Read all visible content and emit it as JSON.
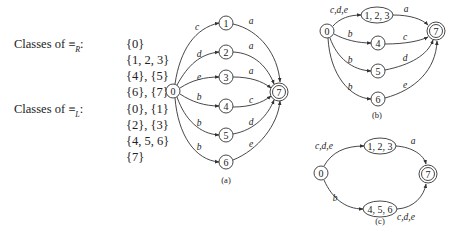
{
  "classes": {
    "right": {
      "label_prefix": "Classes of ≡",
      "label_sub": "R",
      "label_suffix": ":",
      "values": [
        "{0}",
        "{1, 2, 3}",
        "{4}, {5}",
        "{6}, {7}"
      ]
    },
    "left": {
      "label_prefix": "Classes of ≡",
      "label_sub": "L",
      "label_suffix": ":",
      "values": [
        "{0}, {1}",
        "{2}, {3}",
        "{4, 5, 6}",
        "{7}"
      ]
    }
  },
  "diagrams": {
    "a": {
      "caption": "(a)",
      "caption_pos": [
        226,
        183
      ],
      "nodes": [
        {
          "id": "0",
          "label": "0",
          "x": 173,
          "y": 91,
          "rx": 7,
          "ry": 7,
          "final": false
        },
        {
          "id": "1",
          "label": "1",
          "x": 226,
          "y": 23,
          "rx": 7,
          "ry": 7,
          "final": false
        },
        {
          "id": "2",
          "label": "2",
          "x": 226,
          "y": 52,
          "rx": 7,
          "ry": 7,
          "final": false
        },
        {
          "id": "3",
          "label": "3",
          "x": 226,
          "y": 77,
          "rx": 7,
          "ry": 7,
          "final": false
        },
        {
          "id": "4",
          "label": "4",
          "x": 226,
          "y": 106,
          "rx": 7,
          "ry": 7,
          "final": false
        },
        {
          "id": "5",
          "label": "5",
          "x": 226,
          "y": 135,
          "rx": 7,
          "ry": 7,
          "final": false
        },
        {
          "id": "6",
          "label": "6",
          "x": 226,
          "y": 162,
          "rx": 7,
          "ry": 7,
          "final": false
        },
        {
          "id": "7",
          "label": "7",
          "x": 279,
          "y": 92,
          "rx": 9,
          "ry": 9,
          "final": true
        }
      ],
      "edges": [
        {
          "from": "0",
          "to": "1",
          "label": "c",
          "path": "M175,84 C180,50 195,28 219,23",
          "lx": 197,
          "ly": 30
        },
        {
          "from": "0",
          "to": "2",
          "label": "d",
          "path": "M177,85 C188,65 200,54 219,52",
          "lx": 199,
          "ly": 57
        },
        {
          "from": "0",
          "to": "3",
          "label": "e",
          "path": "M180,88 C192,80 205,77 219,77",
          "lx": 199,
          "ly": 80
        },
        {
          "from": "0",
          "to": "4",
          "label": "b",
          "path": "M180,94 C192,102 205,106 219,106",
          "lx": 199,
          "ly": 100
        },
        {
          "from": "0",
          "to": "5",
          "label": "b",
          "path": "M177,97 C185,120 200,134 219,135",
          "lx": 199,
          "ly": 126
        },
        {
          "from": "0",
          "to": "6",
          "label": "b",
          "path": "M175,98 C178,135 195,160 219,162",
          "lx": 199,
          "ly": 150
        },
        {
          "from": "1",
          "to": "7",
          "label": "a",
          "path": "M233,24 C260,30 278,55 280,82",
          "lx": 251,
          "ly": 24
        },
        {
          "from": "2",
          "to": "7",
          "label": "a",
          "path": "M233,52 C255,53 268,68 274,84",
          "lx": 251,
          "ly": 49
        },
        {
          "from": "3",
          "to": "7",
          "label": "a",
          "path": "M233,77 C250,77 262,81 271,88",
          "lx": 251,
          "ly": 74
        },
        {
          "from": "4",
          "to": "7",
          "label": "c",
          "path": "M233,107 C250,107 262,103 271,96",
          "lx": 251,
          "ly": 103
        },
        {
          "from": "5",
          "to": "7",
          "label": "d",
          "path": "M233,134 C255,130 268,115 274,100",
          "lx": 251,
          "ly": 125
        },
        {
          "from": "6",
          "to": "7",
          "label": "e",
          "path": "M233,160 C258,150 278,125 280,101",
          "lx": 251,
          "ly": 147
        }
      ]
    },
    "b": {
      "caption": "(b)",
      "caption_pos": [
        377,
        118
      ],
      "nodes": [
        {
          "id": "0",
          "label": "0",
          "x": 327,
          "y": 31,
          "rx": 7,
          "ry": 7,
          "final": false
        },
        {
          "id": "123",
          "label": "1, 2, 3",
          "x": 377,
          "y": 15,
          "rx": 16,
          "ry": 8,
          "final": false
        },
        {
          "id": "4",
          "label": "4",
          "x": 378,
          "y": 43,
          "rx": 7,
          "ry": 7,
          "final": false
        },
        {
          "id": "5",
          "label": "5",
          "x": 378,
          "y": 71,
          "rx": 7,
          "ry": 7,
          "final": false
        },
        {
          "id": "6",
          "label": "6",
          "x": 378,
          "y": 99,
          "rx": 7,
          "ry": 7,
          "final": false
        },
        {
          "id": "7",
          "label": "7",
          "x": 436,
          "y": 31,
          "rx": 9,
          "ry": 9,
          "final": true
        }
      ],
      "edges": [
        {
          "from": "0",
          "to": "123",
          "label": "c,d,e",
          "path": "M333,26 C340,18 350,15 361,15",
          "lx": 339,
          "ly": 13
        },
        {
          "from": "0",
          "to": "4",
          "label": "b",
          "path": "M334,34 C345,40 358,43 371,43",
          "lx": 350,
          "ly": 37
        },
        {
          "from": "0",
          "to": "5",
          "label": "b",
          "path": "M330,38 C337,58 352,70 371,71",
          "lx": 350,
          "ly": 63
        },
        {
          "from": "0",
          "to": "6",
          "label": "b",
          "path": "M328,38 C330,75 350,98 371,99",
          "lx": 350,
          "ly": 90
        },
        {
          "from": "123",
          "to": "7",
          "label": "a",
          "path": "M393,15 C410,15 422,19 428,25",
          "lx": 406,
          "ly": 12
        },
        {
          "from": "4",
          "to": "7",
          "label": "c",
          "path": "M385,44 C405,44 420,41 428,37",
          "lx": 405,
          "ly": 40
        },
        {
          "from": "5",
          "to": "7",
          "label": "d",
          "path": "M385,70 C410,65 428,55 433,40",
          "lx": 405,
          "ly": 61
        },
        {
          "from": "6",
          "to": "7",
          "label": "e",
          "path": "M385,98 C415,90 436,70 437,41",
          "lx": 405,
          "ly": 88
        }
      ]
    },
    "c": {
      "caption": "(c)",
      "caption_pos": [
        380,
        224
      ],
      "nodes": [
        {
          "id": "0",
          "label": "0",
          "x": 321,
          "y": 173,
          "rx": 7,
          "ry": 7,
          "final": false
        },
        {
          "id": "123",
          "label": "1, 2, 3",
          "x": 380,
          "y": 146,
          "rx": 16,
          "ry": 8,
          "final": false
        },
        {
          "id": "456",
          "label": "4, 5, 6",
          "x": 380,
          "y": 209,
          "rx": 17,
          "ry": 8,
          "final": false
        },
        {
          "id": "7",
          "label": "7",
          "x": 428,
          "y": 174,
          "rx": 9,
          "ry": 9,
          "final": true
        }
      ],
      "edges": [
        {
          "from": "0",
          "to": "123",
          "label": "c,d,e",
          "path": "M324,166 C332,152 345,146 364,146",
          "lx": 324,
          "ly": 149
        },
        {
          "from": "0",
          "to": "456",
          "label": "b",
          "path": "M324,180 C332,198 345,209 363,209",
          "lx": 335,
          "ly": 201
        },
        {
          "from": "123",
          "to": "7",
          "label": "a",
          "path": "M396,146 C412,147 424,155 426,164",
          "lx": 413,
          "ly": 144
        },
        {
          "from": "456",
          "to": "7",
          "label": "c,d,e",
          "path": "M397,209 C414,208 424,196 426,184",
          "lx": 406,
          "ly": 220
        }
      ]
    }
  }
}
